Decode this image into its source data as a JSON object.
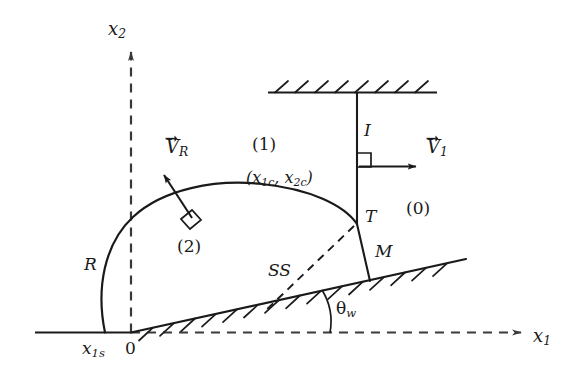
{
  "figure": {
    "kind": "shock-wave-reflection-schematic",
    "background_color": "#ffffff",
    "stroke_color": "#1a1a1a",
    "width": 571,
    "height": 379
  },
  "axes": {
    "x1_label": "x",
    "x1_sub": "1",
    "x2_label": "x",
    "x2_sub": "2",
    "origin_label": "0"
  },
  "labels": {
    "region_incident": "(0)",
    "region_one": "(1)",
    "region_two": "(2)",
    "reflected_shock": "R",
    "incident_shock": "I",
    "mach_stem": "M",
    "triple_point": "T",
    "slipstream": "SS",
    "wedge_angle": "θ",
    "wedge_angle_sub": "w",
    "shock_foot": "x",
    "shock_foot_sub": "1s",
    "curve_center_open": "(x",
    "curve_center_sub1": "1c",
    "curve_center_mid": ", x",
    "curve_center_sub2": "2c",
    "curve_center_close": ")",
    "velocity_reflected": "V",
    "velocity_reflected_sub": "R",
    "velocity_incident": "V",
    "velocity_incident_sub": "1"
  }
}
